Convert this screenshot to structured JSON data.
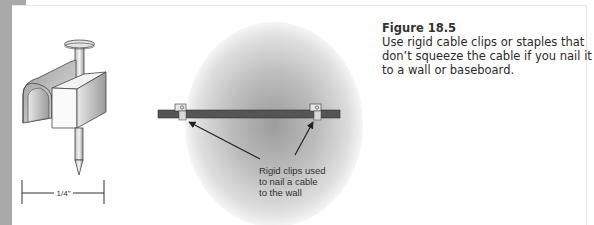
{
  "figure": {
    "number": "Figure 18.5",
    "caption": "Use rigid cable clips or staples that don’t squeeze the cable if you nail it to a wall or baseboard."
  },
  "staple_illustration": {
    "dimension_label": "1/4\""
  },
  "cable_illustration": {
    "callout_lines": [
      "Rigid clips used",
      "to nail a cable",
      "to the wall"
    ]
  },
  "colors": {
    "sidebar_gray": "#a9a9a9",
    "cable": "#555555",
    "clip": "#d8d8d8",
    "text": "#2a2a2a"
  }
}
